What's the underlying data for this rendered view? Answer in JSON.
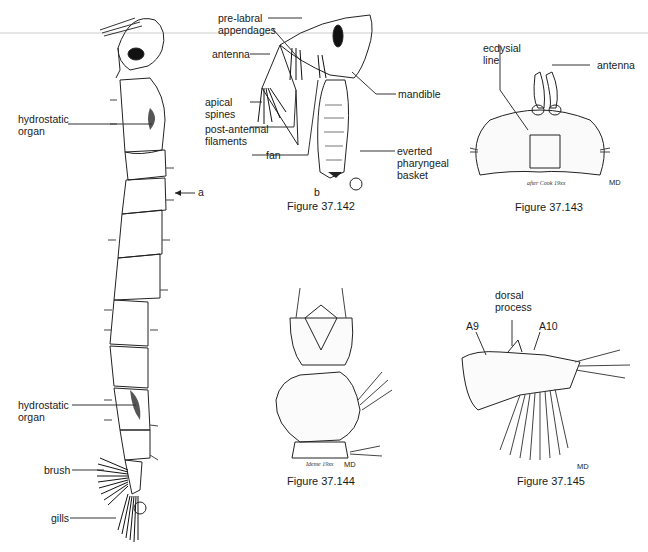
{
  "figures": {
    "larva": {
      "labels": {
        "hydro_top": "hydrostatic\norgan",
        "arrow_a": "a",
        "hydro_bottom": "hydrostatic\norgan",
        "brush": "brush",
        "gills": "gills"
      }
    },
    "fig142": {
      "caption": "Figure 37.142",
      "sub_b": "b",
      "labels": {
        "prelabral": "pre-labral\nappendages",
        "antenna": "antenna",
        "apical": "apical\nspines",
        "postantennal": "post-antennal\nfilaments",
        "fan": "fan",
        "mandible": "mandible",
        "everted": "everted\npharyngeal\nbasket"
      }
    },
    "fig143": {
      "caption": "Figure 37.143",
      "credit": "after Cook 19xx",
      "signature": "MD",
      "labels": {
        "ecdysial": "ecdysial\nline",
        "antenna": "antenna"
      }
    },
    "fig144": {
      "caption": "Figure 37.144",
      "credit": "Ideme 19xx",
      "signature": "MD"
    },
    "fig145": {
      "caption": "Figure 37.145",
      "signature": "MD",
      "labels": {
        "dorsal": "dorsal\nprocess",
        "a9": "A9",
        "a10": "A10"
      }
    }
  }
}
